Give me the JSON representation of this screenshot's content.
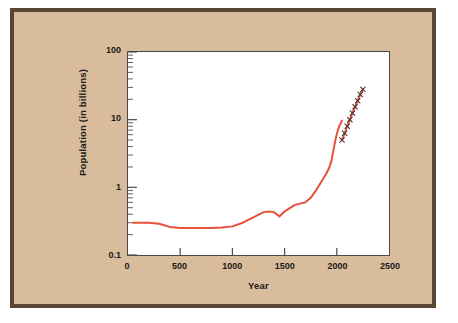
{
  "figure": {
    "background_color": "#d9bc9c",
    "border_color": "#5a4733",
    "plot_background": "#ffffff"
  },
  "chart_data": {
    "type": "line",
    "title": "",
    "xlabel": "Year",
    "ylabel": "Population (in billions)",
    "xlim": [
      0,
      2500
    ],
    "ylim": [
      0.1,
      100
    ],
    "yscale": "log",
    "xscale": "linear",
    "grid": false,
    "legend": null,
    "xticks": [
      0,
      500,
      1000,
      1500,
      2000,
      2500
    ],
    "xticklabels": [
      "0",
      "500",
      "1000",
      "1500",
      "2000",
      "2500"
    ],
    "yticks": [
      0.1,
      1,
      10,
      100
    ],
    "yticklabels": [
      "0.1",
      "1",
      "10",
      "100"
    ],
    "y_minor_ticks": true,
    "series": [
      {
        "name": "Historical population",
        "color": "#e8503a",
        "marker": "none",
        "linewidth": 2,
        "x": [
          50,
          200,
          300,
          400,
          500,
          600,
          700,
          800,
          900,
          1000,
          1100,
          1200,
          1300,
          1350,
          1400,
          1450,
          1500,
          1600,
          1700,
          1750,
          1800,
          1850,
          1900,
          1930,
          1950,
          1970,
          1990,
          2000,
          2020,
          2050
        ],
        "y": [
          0.3,
          0.3,
          0.29,
          0.26,
          0.25,
          0.25,
          0.25,
          0.25,
          0.255,
          0.265,
          0.3,
          0.36,
          0.43,
          0.44,
          0.43,
          0.37,
          0.44,
          0.55,
          0.6,
          0.7,
          0.9,
          1.2,
          1.6,
          2.0,
          2.5,
          3.7,
          5.3,
          6.1,
          7.8,
          9.7
        ]
      },
      {
        "name": "Projected population",
        "color": "#e8503a",
        "marker": "x",
        "marker_color": "#4a3530",
        "linewidth": 2,
        "x": [
          2050,
          2075,
          2100,
          2125,
          2150,
          2175,
          2200,
          2225,
          2250
        ],
        "y": [
          5.0,
          6.3,
          8.0,
          10.0,
          12.5,
          15.5,
          19.0,
          23.5,
          28.0
        ]
      }
    ],
    "annotations": []
  },
  "axes": {
    "x_title": "Year",
    "y_title": "Population (in billions)"
  }
}
